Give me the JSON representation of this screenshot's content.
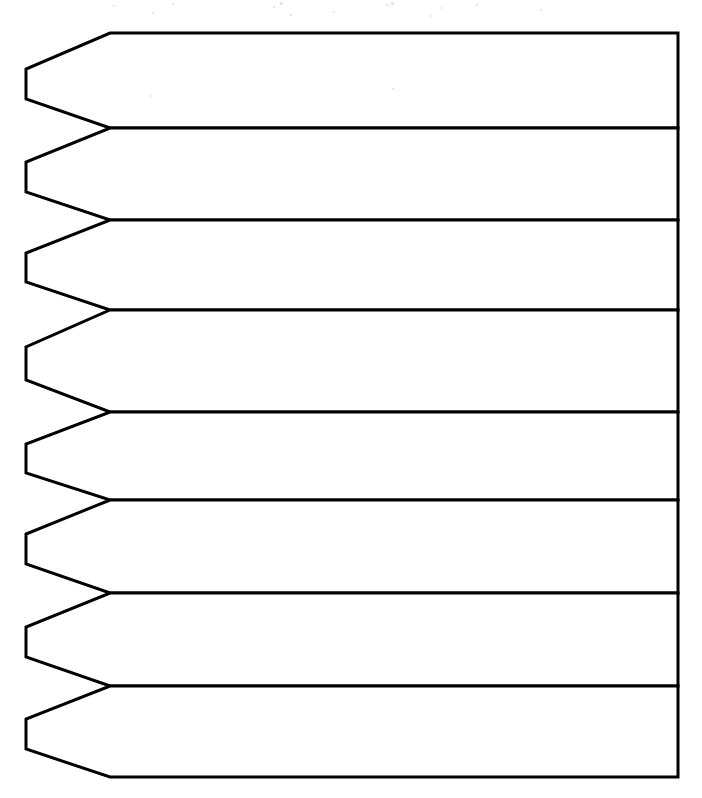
{
  "figure": {
    "title": "Stacked Pointed Banner Strips",
    "background_color": "#ffffff",
    "stroke_color": "#000000",
    "stroke_width": 3,
    "fill_color": "#ffffff",
    "band_count": 8,
    "canvas": {
      "width": 702,
      "height": 798
    }
  },
  "geometry": {
    "right_edge_x": 678,
    "bend_x": 110,
    "tip_x": 26,
    "divider_y": [
      33,
      128,
      220,
      310,
      412,
      500,
      593,
      686,
      777
    ],
    "tip_inset_ratio": 0.36
  },
  "chart_data": {
    "type": "table",
    "title": "Stacked Pointed Banner Strips",
    "xlabel": "",
    "ylabel": "",
    "categories": [
      "Strip 1",
      "Strip 2",
      "Strip 3",
      "Strip 4",
      "Strip 5",
      "Strip 6",
      "Strip 7",
      "Strip 8"
    ],
    "bands": [
      {
        "index": 1,
        "label": "Strip 1",
        "top_y": 33,
        "bottom_y": 128,
        "height": 95,
        "tip_top_y": 69,
        "tip_bottom_y": 99
      },
      {
        "index": 2,
        "label": "Strip 2",
        "top_y": 128,
        "bottom_y": 220,
        "height": 92,
        "tip_top_y": 162,
        "tip_bottom_y": 192
      },
      {
        "index": 3,
        "label": "Strip 3",
        "top_y": 220,
        "bottom_y": 310,
        "height": 90,
        "tip_top_y": 253,
        "tip_bottom_y": 282
      },
      {
        "index": 4,
        "label": "Strip 4",
        "top_y": 310,
        "bottom_y": 412,
        "height": 102,
        "tip_top_y": 347,
        "tip_bottom_y": 380
      },
      {
        "index": 5,
        "label": "Strip 5",
        "top_y": 412,
        "bottom_y": 500,
        "height": 88,
        "tip_top_y": 444,
        "tip_bottom_y": 473
      },
      {
        "index": 6,
        "label": "Strip 6",
        "top_y": 500,
        "bottom_y": 593,
        "height": 93,
        "tip_top_y": 534,
        "tip_bottom_y": 564
      },
      {
        "index": 7,
        "label": "Strip 7",
        "top_y": 593,
        "bottom_y": 686,
        "height": 93,
        "tip_top_y": 627,
        "tip_bottom_y": 657
      },
      {
        "index": 8,
        "label": "Strip 8",
        "top_y": 686,
        "bottom_y": 777,
        "height": 91,
        "tip_top_y": 719,
        "tip_bottom_y": 749
      }
    ],
    "values": [
      95,
      92,
      90,
      102,
      88,
      93,
      93,
      91
    ],
    "ylim": [
      33,
      777
    ],
    "grid": false,
    "legend": "none"
  },
  "annotations": {
    "labels": [],
    "notes": ""
  },
  "artifacts": {
    "description": "Faint light-gray scanner specks across the upper margin of the page.",
    "specks": [
      {
        "x": 113,
        "y": 5,
        "size": 2
      },
      {
        "x": 172,
        "y": 3,
        "size": 2
      },
      {
        "x": 273,
        "y": 6,
        "size": 2
      },
      {
        "x": 280,
        "y": 2,
        "size": 3
      },
      {
        "x": 386,
        "y": 4,
        "size": 2
      },
      {
        "x": 391,
        "y": 2,
        "size": 3
      },
      {
        "x": 441,
        "y": 7,
        "size": 2
      },
      {
        "x": 476,
        "y": 4,
        "size": 2
      },
      {
        "x": 152,
        "y": 12,
        "size": 2
      },
      {
        "x": 290,
        "y": 14,
        "size": 2
      },
      {
        "x": 333,
        "y": 11,
        "size": 2
      },
      {
        "x": 430,
        "y": 15,
        "size": 2
      },
      {
        "x": 540,
        "y": 9,
        "size": 2
      },
      {
        "x": 150,
        "y": 95,
        "size": 2
      },
      {
        "x": 392,
        "y": 88,
        "size": 2
      }
    ]
  }
}
